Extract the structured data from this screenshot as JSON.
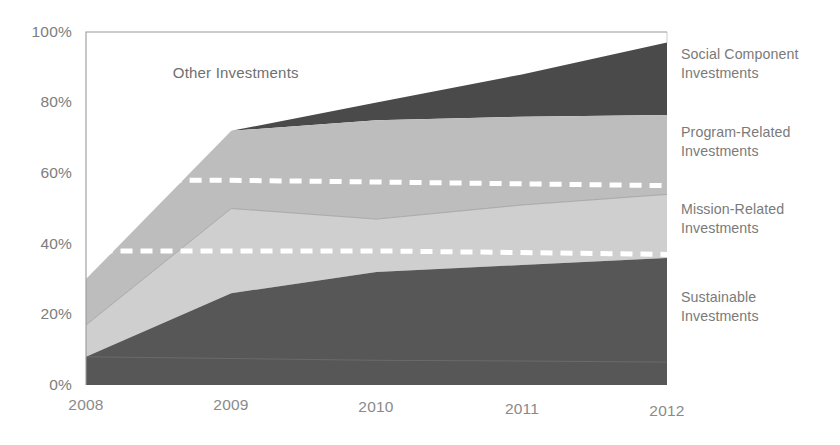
{
  "chart_data": {
    "type": "area",
    "title": "",
    "subtitle": "",
    "xlabel": "",
    "ylabel": "",
    "x": [
      "2008",
      "2009",
      "2010",
      "2011",
      "2012"
    ],
    "categories": [
      "2008",
      "2009",
      "2010",
      "2011",
      "2012"
    ],
    "stacked": true,
    "normalized": true,
    "ylim": [
      0,
      100
    ],
    "y_tick_labels": [
      "0%",
      "20%",
      "40%",
      "60%",
      "80%",
      "100%"
    ],
    "y_ticks": [
      0,
      20,
      40,
      60,
      80,
      100
    ],
    "grid": false,
    "legend_position": "right-outside",
    "series": [
      {
        "name": "Sustainable Investments",
        "values": [
          8,
          26,
          32,
          34,
          36
        ],
        "cumulative_top": [
          8,
          26,
          32,
          34,
          36
        ],
        "color": "#575757",
        "legend_label_lines": [
          "Sustainable",
          "Investments"
        ]
      },
      {
        "name": "Mission-Related Investments",
        "values": [
          9,
          24,
          15,
          17,
          18
        ],
        "cumulative_top": [
          17,
          50,
          47,
          51,
          54
        ],
        "color": "#cfcfcf",
        "legend_label_lines": [
          "Mission-Related",
          "Investments"
        ]
      },
      {
        "name": "Program-Related Investments",
        "values": [
          13,
          22,
          28,
          25,
          22.5
        ],
        "cumulative_top": [
          30,
          72,
          75,
          76,
          76.5
        ],
        "color": "#bdbdbd",
        "legend_label_lines": [
          "Program-Related",
          "Investments"
        ]
      },
      {
        "name": "Social Component Investments",
        "values": [
          0,
          0,
          5,
          12,
          20.5
        ],
        "cumulative_top": [
          30,
          72,
          80,
          88,
          97
        ],
        "color": "#4a4a4a",
        "legend_label_lines": [
          "Social Component",
          "Investments"
        ]
      }
    ],
    "bottom_band": {
      "name": "baseline-band",
      "top_values": [
        8,
        7.5,
        7,
        6.8,
        6.5
      ],
      "color": "#5f5f5f"
    },
    "annotations": [
      {
        "name": "other-investments",
        "text": "Other Investments",
        "x_pct": 17.0,
        "y_pct": 88.0
      }
    ],
    "reference_lines": [
      {
        "name": "upper-reference-line",
        "style": "dashed",
        "color": "#ffffff",
        "y_values": [
          58,
          58,
          57.5,
          57,
          56.5
        ],
        "x_start": "2008.3",
        "x_end": "2012"
      },
      {
        "name": "lower-reference-line",
        "style": "dashed",
        "color": "#ffffff",
        "y_values": [
          38,
          38,
          38,
          37.5,
          37
        ],
        "x_start": "2008.1",
        "x_end": "2012"
      }
    ]
  },
  "axes": {
    "y_labels": [
      "100%",
      "80%",
      "60%",
      "40%",
      "20%",
      "0%"
    ],
    "x_labels": [
      "2008",
      "2009",
      "2010",
      "2011",
      "2012"
    ]
  },
  "legend": {
    "entries": [
      {
        "line1": "Social Component",
        "line2": "Investments"
      },
      {
        "line1": "Program-Related",
        "line2": "Investments"
      },
      {
        "line1": "Mission-Related",
        "line2": "Investments"
      },
      {
        "line1": "Sustainable",
        "line2": "Investments"
      }
    ]
  },
  "annotation": {
    "other_investments": "Other Investments"
  },
  "colors": {
    "social_component": "#4a4a4a",
    "program_related": "#bdbdbd",
    "mission_related": "#cfcfcf",
    "sustainable": "#575757",
    "baseline_band": "#5f5f5f",
    "axis_line": "#9a9a9a",
    "tick_text": "#7d7d7d",
    "legend_text": "#7a7a7a",
    "reference_line": "#ffffff",
    "background": "#ffffff"
  }
}
